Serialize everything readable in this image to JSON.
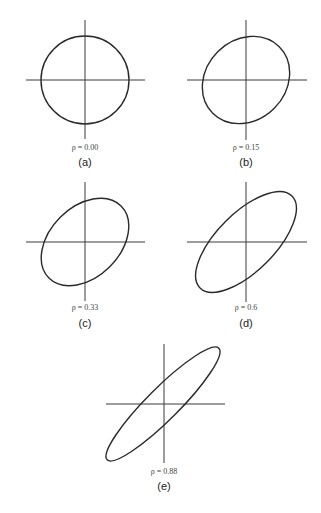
{
  "figure": {
    "panels": [
      {
        "id": "a",
        "tag": "(a)",
        "rho_label": "ρ = 0.00",
        "rho": 0.0,
        "cx": 85,
        "cy": 80,
        "rx": 44,
        "ry": 44,
        "angle": 0,
        "label_y": 150,
        "tag_y": 165
      },
      {
        "id": "b",
        "tag": "(b)",
        "rho_label": "ρ = 0.15",
        "rho": 0.15,
        "cx": 246,
        "cy": 80,
        "rx": 47,
        "ry": 40,
        "angle": -45,
        "label_y": 150,
        "tag_y": 165
      },
      {
        "id": "c",
        "tag": "(c)",
        "rho_label": "ρ = 0.33",
        "rho": 0.33,
        "cx": 85,
        "cy": 242,
        "rx": 51,
        "ry": 35,
        "angle": -45,
        "label_y": 310,
        "tag_y": 326
      },
      {
        "id": "d",
        "tag": "(d)",
        "rho_label": "ρ = 0.6",
        "rho": 0.6,
        "cx": 246,
        "cy": 242,
        "rx": 65,
        "ry": 29,
        "angle": -45,
        "label_y": 310,
        "tag_y": 326
      },
      {
        "id": "e",
        "tag": "(e)",
        "rho_label": "ρ = 0.88",
        "rho": 0.88,
        "cx": 163,
        "cy": 404,
        "rx": 79,
        "ry": 16,
        "angle": -45,
        "label_y": 474,
        "tag_y": 489
      }
    ]
  },
  "colors": {
    "line": "#2a2a2a",
    "axis": "#3a3a3a",
    "text": "#222222"
  }
}
